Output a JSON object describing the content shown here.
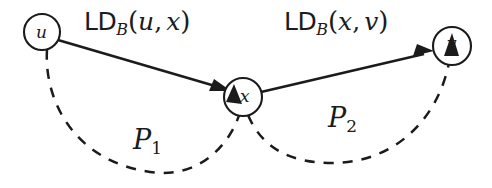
{
  "figure": {
    "kind": "graph-diagram",
    "background_color": "#ffffff",
    "ink_color": "#1b1b1b",
    "width": 492,
    "height": 188
  },
  "nodes": [
    {
      "id": "u",
      "label": "u",
      "cx": 42,
      "cy": 32,
      "r": 18
    },
    {
      "id": "x",
      "label": "x",
      "cx": 243,
      "cy": 97,
      "r": 19
    },
    {
      "id": "v",
      "label": "v",
      "cx": 452,
      "cy": 46,
      "r": 19
    }
  ],
  "edges": [
    {
      "id": "u-to-x",
      "from": "u",
      "to": "x",
      "style": "solid",
      "arrow": true,
      "label": {
        "prefix": "LD",
        "subscript": "B",
        "open": "(",
        "arg1": "u",
        "separator": ",",
        "arg2": "x",
        "close": ")",
        "text": "LD_B(u, x)"
      }
    },
    {
      "id": "x-to-v",
      "from": "x",
      "to": "v",
      "style": "solid",
      "arrow": true,
      "label": {
        "prefix": "LD",
        "subscript": "B",
        "open": "(",
        "arg1": "x",
        "separator": ",",
        "arg2": "v",
        "close": ")",
        "text": "LD_B(x, v)"
      }
    },
    {
      "id": "path-P1",
      "from": "u",
      "to": "x",
      "style": "dashed",
      "arrow": true,
      "label": {
        "name": "P",
        "index": "1",
        "text": "P1"
      }
    },
    {
      "id": "path-P2",
      "from": "x",
      "to": "v",
      "style": "dashed",
      "arrow": true,
      "label": {
        "name": "P",
        "index": "2",
        "text": "P2"
      }
    }
  ],
  "labels": {
    "edge_ux": {
      "prefix": "LD",
      "subscript": "B",
      "open": "(",
      "arg1": "u",
      "separator": ",",
      "arg2": "x",
      "close": ")"
    },
    "edge_xv": {
      "prefix": "LD",
      "subscript": "B",
      "open": "(",
      "arg1": "x",
      "separator": ",",
      "arg2": "v",
      "close": ")"
    },
    "path1": {
      "name": "P",
      "index": "1"
    },
    "path2": {
      "name": "P",
      "index": "2"
    },
    "node_u": "u",
    "node_x": "x",
    "node_v": "v"
  }
}
